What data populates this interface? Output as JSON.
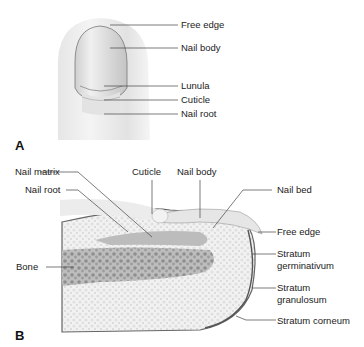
{
  "panel_a": {
    "letter": "A",
    "labels": {
      "free_edge": "Free edge",
      "nail_body": "Nail body",
      "lunula": "Lunula",
      "cuticle": "Cuticle",
      "nail_root": "Nail root"
    }
  },
  "panel_b": {
    "letter": "B",
    "labels": {
      "nail_matrix": "Nail matrix",
      "nail_root": "Nail root",
      "cuticle": "Cuticle",
      "nail_body": "Nail body",
      "nail_bed": "Nail bed",
      "free_edge": "Free edge",
      "bone": "Bone",
      "stratum_germinativum_1": "Stratum",
      "stratum_germinativum_2": "germinativum",
      "stratum_granulosum_1": "Stratum",
      "stratum_granulosum_2": "granulosum",
      "stratum_corneum": "Stratum corneum"
    }
  }
}
